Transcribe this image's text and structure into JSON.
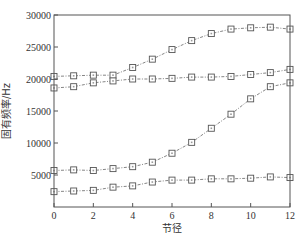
{
  "chart_data": {
    "type": "line",
    "title": "",
    "xlabel": "节径",
    "ylabel": "固有频率/Hz",
    "xlim": [
      0,
      12
    ],
    "ylim": [
      0,
      30000
    ],
    "xticks": [
      0,
      2,
      4,
      6,
      8,
      10,
      12
    ],
    "yticks": [
      5000,
      10000,
      15000,
      20000,
      25000,
      30000
    ],
    "grid": false,
    "legend": null,
    "marker": "square",
    "line_style": "dash-dot",
    "x": [
      0,
      1,
      2,
      3,
      4,
      5,
      6,
      7,
      8,
      9,
      10,
      11,
      12
    ],
    "series": [
      {
        "name": "mode-1",
        "values": [
          20400,
          20500,
          20600,
          20600,
          21800,
          23100,
          24600,
          26000,
          27100,
          27800,
          28000,
          28100,
          27800
        ]
      },
      {
        "name": "mode-2",
        "values": [
          18600,
          18800,
          19400,
          19700,
          20000,
          20000,
          20100,
          20300,
          20300,
          20400,
          20700,
          21000,
          21500
        ]
      },
      {
        "name": "mode-3",
        "values": [
          5700,
          5800,
          5700,
          6000,
          6300,
          7000,
          8400,
          10100,
          12300,
          14500,
          16900,
          18800,
          19400
        ]
      },
      {
        "name": "mode-4",
        "values": [
          2400,
          2500,
          2600,
          3100,
          3300,
          3900,
          4200,
          4200,
          4400,
          4400,
          4500,
          4700,
          4600
        ]
      }
    ]
  },
  "colors": {
    "axis": "#555555",
    "line": "#666666",
    "marker": "#555555"
  }
}
